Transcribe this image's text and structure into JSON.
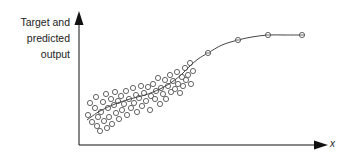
{
  "chart_data": {
    "type": "scatter",
    "title": "",
    "xlabel": "x",
    "ylabel": "Target and predicted output",
    "ylabel_lines": [
      "Target and",
      "predicted",
      "output"
    ],
    "grid": false,
    "legend": null,
    "axes_style": "arrows, no ticks",
    "colors": {
      "axis": "#111111",
      "curve": "#444444",
      "marker": "#555555"
    },
    "curve": {
      "name": "predicted output",
      "points": [
        [
          87,
          120
        ],
        [
          100,
          111
        ],
        [
          115,
          104
        ],
        [
          130,
          99
        ],
        [
          145,
          95
        ],
        [
          160,
          89
        ],
        [
          172,
          82
        ],
        [
          182,
          74
        ],
        [
          190,
          66
        ],
        [
          198,
          59
        ],
        [
          208,
          53
        ],
        [
          222,
          45
        ],
        [
          238,
          40
        ],
        [
          252,
          37
        ],
        [
          268,
          35
        ],
        [
          285,
          35
        ],
        [
          302,
          35
        ]
      ]
    },
    "curve_markers": [
      [
        208,
        53
      ],
      [
        238,
        40
      ],
      [
        268,
        35
      ],
      [
        302,
        35
      ]
    ],
    "scatter_points": [
      [
        88,
        115
      ],
      [
        90,
        103
      ],
      [
        92,
        122
      ],
      [
        95,
        108
      ],
      [
        96,
        97
      ],
      [
        97,
        126
      ],
      [
        98,
        117
      ],
      [
        100,
        131
      ],
      [
        101,
        112
      ],
      [
        103,
        102
      ],
      [
        104,
        121
      ],
      [
        106,
        94
      ],
      [
        107,
        128
      ],
      [
        108,
        108
      ],
      [
        109,
        117
      ],
      [
        111,
        99
      ],
      [
        112,
        124
      ],
      [
        114,
        105
      ],
      [
        115,
        92
      ],
      [
        116,
        113
      ],
      [
        118,
        101
      ],
      [
        119,
        119
      ],
      [
        121,
        96
      ],
      [
        122,
        110
      ],
      [
        124,
        104
      ],
      [
        126,
        91
      ],
      [
        127,
        115
      ],
      [
        129,
        99
      ],
      [
        131,
        108
      ],
      [
        133,
        88
      ],
      [
        134,
        103
      ],
      [
        136,
        95
      ],
      [
        137,
        112
      ],
      [
        139,
        98
      ],
      [
        141,
        86
      ],
      [
        142,
        106
      ],
      [
        144,
        93
      ],
      [
        146,
        101
      ],
      [
        148,
        87
      ],
      [
        150,
        110
      ],
      [
        151,
        96
      ],
      [
        153,
        84
      ],
      [
        155,
        99
      ],
      [
        156,
        91
      ],
      [
        158,
        78
      ],
      [
        160,
        104
      ],
      [
        161,
        88
      ],
      [
        163,
        94
      ],
      [
        165,
        80
      ],
      [
        166,
        99
      ],
      [
        168,
        86
      ],
      [
        170,
        75
      ],
      [
        171,
        92
      ],
      [
        173,
        81
      ],
      [
        175,
        89
      ],
      [
        177,
        72
      ],
      [
        178,
        84
      ],
      [
        180,
        93
      ],
      [
        182,
        77
      ],
      [
        183,
        86
      ],
      [
        185,
        68
      ],
      [
        186,
        80
      ],
      [
        188,
        75
      ],
      [
        190,
        63
      ],
      [
        191,
        84
      ],
      [
        193,
        71
      ]
    ],
    "axis_geometry": {
      "origin": [
        79,
        145
      ],
      "y_top": 11,
      "x_right": 330
    }
  }
}
